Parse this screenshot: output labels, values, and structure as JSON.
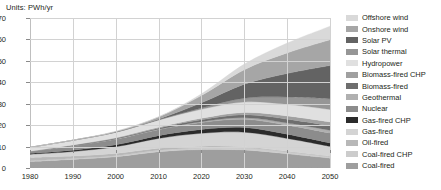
{
  "units_label": "Units: PWh/yr",
  "legend": {
    "items": [
      {
        "label": "Offshore wind",
        "color": "#d9d9d9"
      },
      {
        "label": "Onshore wind",
        "color": "#a6a6a6"
      },
      {
        "label": "Solar PV",
        "color": "#636363"
      },
      {
        "label": "Solar thermal",
        "color": "#969696"
      },
      {
        "label": "Hydropower",
        "color": "#e0e0e0"
      },
      {
        "label": "Biomass-fired CHP",
        "color": "#a0a0a0"
      },
      {
        "label": "Biomass-fired",
        "color": "#6e6e6e"
      },
      {
        "label": "Geothermal",
        "color": "#b0b0b0"
      },
      {
        "label": "Nuclear",
        "color": "#8c8c8c"
      },
      {
        "label": "Gas-fired CHP",
        "color": "#2b2b2b"
      },
      {
        "label": "Gas-fired",
        "color": "#d4d4d4"
      },
      {
        "label": "Oil-fired",
        "color": "#b8b8b8"
      },
      {
        "label": "Coal-fired CHP",
        "color": "#cccccc"
      },
      {
        "label": "Coal-fired",
        "color": "#9e9e9e"
      }
    ]
  },
  "chart_data": {
    "type": "area",
    "title": "Units: PWh/yr",
    "xlabel": "",
    "ylabel": "PWh/yr",
    "xlim": [
      1980,
      2050
    ],
    "ylim": [
      0,
      70
    ],
    "yticks": [
      0,
      10,
      20,
      30,
      40,
      50,
      60,
      70
    ],
    "xticks": [
      1980,
      1990,
      2000,
      2010,
      2020,
      2030,
      2040,
      2050
    ],
    "grid": true,
    "legend_position": "right",
    "stacked": true,
    "stack_order_bottom_to_top": [
      "Coal-fired",
      "Coal-fired CHP",
      "Oil-fired",
      "Gas-fired",
      "Gas-fired CHP",
      "Nuclear",
      "Geothermal",
      "Biomass-fired",
      "Biomass-fired CHP",
      "Hydropower",
      "Solar thermal",
      "Solar PV",
      "Onshore wind",
      "Offshore wind"
    ],
    "x": [
      1980,
      1990,
      2000,
      2010,
      2020,
      2030,
      2040,
      2050
    ],
    "series": [
      {
        "name": "Coal-fired",
        "color": "#9e9e9e",
        "values": [
          3.0,
          4.0,
          5.2,
          7.6,
          8.6,
          8.4,
          6.6,
          4.6
        ]
      },
      {
        "name": "Coal-fired CHP",
        "color": "#cccccc",
        "values": [
          0.3,
          0.4,
          0.5,
          0.7,
          0.9,
          1.0,
          0.9,
          0.7
        ]
      },
      {
        "name": "Oil-fired",
        "color": "#b8b8b8",
        "values": [
          1.6,
          1.2,
          1.1,
          0.9,
          0.7,
          0.5,
          0.3,
          0.2
        ]
      },
      {
        "name": "Gas-fired",
        "color": "#d4d4d4",
        "values": [
          1.5,
          2.1,
          3.1,
          4.6,
          6.0,
          6.8,
          6.0,
          4.6
        ]
      },
      {
        "name": "Gas-fired CHP",
        "color": "#2b2b2b",
        "values": [
          0.4,
          0.6,
          0.9,
          1.3,
          1.8,
          2.2,
          2.0,
          1.6
        ]
      },
      {
        "name": "Nuclear",
        "color": "#8c8c8c",
        "values": [
          0.8,
          2.0,
          2.6,
          2.8,
          3.2,
          3.8,
          4.2,
          4.6
        ]
      },
      {
        "name": "Geothermal",
        "color": "#b0b0b0",
        "values": [
          0.05,
          0.1,
          0.15,
          0.2,
          0.4,
          0.7,
          1.0,
          1.3
        ]
      },
      {
        "name": "Biomass-fired",
        "color": "#6e6e6e",
        "values": [
          0.1,
          0.2,
          0.3,
          0.5,
          0.9,
          1.4,
          1.8,
          2.1
        ]
      },
      {
        "name": "Biomass-fired CHP",
        "color": "#a0a0a0",
        "values": [
          0.1,
          0.15,
          0.25,
          0.4,
          0.7,
          1.1,
          1.5,
          1.8
        ]
      },
      {
        "name": "Hydropower",
        "color": "#e0e0e0",
        "values": [
          1.8,
          2.2,
          2.6,
          3.4,
          4.2,
          4.9,
          5.4,
          5.8
        ]
      },
      {
        "name": "Solar thermal",
        "color": "#969696",
        "values": [
          0.0,
          0.0,
          0.02,
          0.1,
          0.6,
          1.8,
          3.4,
          5.0
        ]
      },
      {
        "name": "Solar PV",
        "color": "#636363",
        "values": [
          0.0,
          0.0,
          0.05,
          0.3,
          2.4,
          6.5,
          11.0,
          15.5
        ]
      },
      {
        "name": "Onshore wind",
        "color": "#a6a6a6",
        "values": [
          0.0,
          0.05,
          0.3,
          1.0,
          3.4,
          6.8,
          9.6,
          12.0
        ]
      },
      {
        "name": "Offshore wind",
        "color": "#d9d9d9",
        "values": [
          0.0,
          0.0,
          0.02,
          0.1,
          0.8,
          2.6,
          4.6,
          6.4
        ]
      }
    ],
    "totals": [
      9.65,
      13.0,
      17.09,
      23.9,
      34.6,
      48.5,
      58.3,
      66.2
    ]
  }
}
